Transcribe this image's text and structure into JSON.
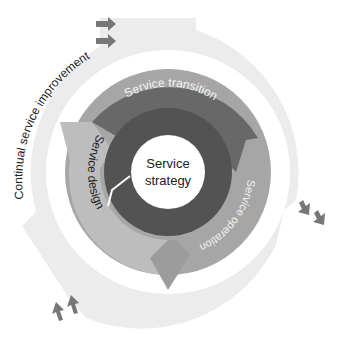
{
  "diagram": {
    "center": {
      "line1": "Service",
      "line2": "strategy"
    },
    "rings": {
      "transition": "Service transition",
      "operation": "Service operation",
      "design": "Service design",
      "improvement": "Continual service improvement"
    },
    "colors": {
      "background": "#ffffff",
      "center_fill": "#ffffff",
      "strategy_ring": "#555555",
      "transition_arc": "#6a6a6a",
      "design_operation_ring": "#a3a3a3",
      "design_arrow": "#b9b9b9",
      "operation_arrow": "#9a9a9a",
      "improvement_ring": "#ececec",
      "small_arrows": "#777777",
      "text_dark": "#222222",
      "text_light": "#f2f2f2"
    }
  }
}
